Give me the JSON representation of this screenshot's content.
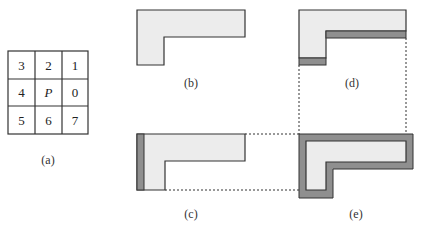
{
  "figure": {
    "neighborhood_grid": {
      "rows": [
        [
          "3",
          "2",
          "1"
        ],
        [
          "4",
          "P",
          "0"
        ],
        [
          "5",
          "6",
          "7"
        ]
      ],
      "center_label": "P",
      "caption": "(a)"
    },
    "panels": {
      "b": {
        "caption": "(b)",
        "description": "L-shaped region"
      },
      "c": {
        "caption": "(c)",
        "description": "L-shape with left border band highlighted"
      },
      "d": {
        "caption": "(d)",
        "description": "L-shape with bottom border bands highlighted"
      },
      "e": {
        "caption": "(e)",
        "description": "L-shape with full surrounding border"
      }
    },
    "colors": {
      "region_fill": "#ececec",
      "band_fill": "#8f8f8f",
      "stroke": "#333333"
    }
  }
}
